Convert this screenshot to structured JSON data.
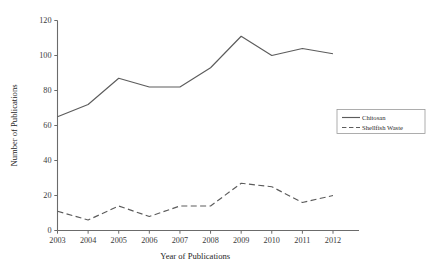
{
  "chart_data": {
    "type": "line",
    "title": "",
    "xlabel": "Year of Publications",
    "ylabel": "Number of Publications",
    "categories": [
      "2003",
      "2004",
      "2005",
      "2006",
      "2007",
      "2008",
      "2009",
      "2010",
      "2011",
      "2012"
    ],
    "x": [
      2003,
      2004,
      2005,
      2006,
      2007,
      2008,
      2009,
      2010,
      2011,
      2012
    ],
    "series": [
      {
        "name": "Chitosan",
        "style": "solid",
        "color": "#5c5c5c",
        "values": [
          65,
          72,
          87,
          82,
          82,
          93,
          111,
          100,
          104,
          101
        ]
      },
      {
        "name": "Shellfish Waste",
        "style": "dashed",
        "color": "#5c5c5c",
        "values": [
          11,
          6,
          14,
          8,
          14,
          14,
          27,
          25,
          16,
          20
        ]
      }
    ],
    "ylim": [
      0,
      120
    ],
    "yticks": [
      0,
      20,
      40,
      60,
      80,
      100,
      120
    ],
    "ytick_labels": [
      "0",
      "20",
      "40",
      "60",
      "80",
      "100",
      "120"
    ],
    "xlim": [
      2003,
      2012
    ],
    "grid": false,
    "legend_position": "right-middle"
  },
  "axes": {
    "y_title": "Number of Publications",
    "x_title": "Year of Publications"
  },
  "legend": {
    "entries": [
      {
        "label": "Chitosan",
        "style": "solid"
      },
      {
        "label": "Shellfish Waste",
        "style": "dashed"
      }
    ]
  }
}
